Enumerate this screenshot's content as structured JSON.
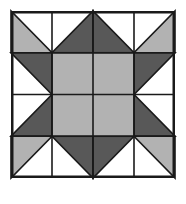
{
  "figure": {
    "name": "quilt-block-pattern",
    "canvas": {
      "width": 186,
      "height": 204,
      "background": "#ffffff"
    }
  },
  "colors": {
    "background": "#ffffff",
    "white": "#ffffff",
    "light_gray": "#b2b2b2",
    "dark_gray": "#585858",
    "outline": "#1a1a1a",
    "border": "#1a1a1a"
  },
  "block": {
    "x": 11,
    "y": 11,
    "width": 164,
    "height": 167,
    "grid_rows": 4,
    "grid_cols": 4,
    "cell_width": 41,
    "cell_height": 41.75,
    "border_width": 2.5,
    "grid_line_width": 1.6
  },
  "chart_data": {
    "type": "diagram",
    "grid": {
      "rows": 4,
      "cols": 4
    },
    "legend": [
      {
        "label": "Light gray",
        "color": "#b2b2b2"
      },
      {
        "label": "Dark gray",
        "color": "#585858"
      },
      {
        "label": "White",
        "color": "#ffffff"
      }
    ],
    "cells": [
      {
        "row": 0,
        "col": 0,
        "shape": "half-square-triangle",
        "orientation": "lower-left",
        "fill": "#b2b2b2",
        "other": "#ffffff"
      },
      {
        "row": 0,
        "col": 1,
        "shape": "half-square-triangle",
        "orientation": "lower-right",
        "fill": "#585858",
        "other": "#ffffff"
      },
      {
        "row": 0,
        "col": 2,
        "shape": "half-square-triangle",
        "orientation": "lower-left",
        "fill": "#585858",
        "other": "#ffffff"
      },
      {
        "row": 0,
        "col": 3,
        "shape": "half-square-triangle",
        "orientation": "lower-right",
        "fill": "#b2b2b2",
        "other": "#ffffff"
      },
      {
        "row": 1,
        "col": 0,
        "shape": "half-square-triangle",
        "orientation": "upper-right",
        "fill": "#585858",
        "other": "#ffffff"
      },
      {
        "row": 1,
        "col": 1,
        "shape": "solid",
        "fill": "#b2b2b2"
      },
      {
        "row": 1,
        "col": 2,
        "shape": "solid",
        "fill": "#b2b2b2"
      },
      {
        "row": 1,
        "col": 3,
        "shape": "half-square-triangle",
        "orientation": "upper-left",
        "fill": "#585858",
        "other": "#ffffff"
      },
      {
        "row": 2,
        "col": 0,
        "shape": "half-square-triangle",
        "orientation": "lower-right",
        "fill": "#585858",
        "other": "#ffffff"
      },
      {
        "row": 2,
        "col": 1,
        "shape": "solid",
        "fill": "#b2b2b2"
      },
      {
        "row": 2,
        "col": 2,
        "shape": "solid",
        "fill": "#b2b2b2"
      },
      {
        "row": 2,
        "col": 3,
        "shape": "half-square-triangle",
        "orientation": "lower-left",
        "fill": "#585858",
        "other": "#ffffff"
      },
      {
        "row": 3,
        "col": 0,
        "shape": "half-square-triangle",
        "orientation": "upper-left",
        "fill": "#b2b2b2",
        "other": "#ffffff"
      },
      {
        "row": 3,
        "col": 1,
        "shape": "half-square-triangle",
        "orientation": "upper-right",
        "fill": "#585858",
        "other": "#ffffff"
      },
      {
        "row": 3,
        "col": 2,
        "shape": "half-square-triangle",
        "orientation": "upper-left",
        "fill": "#585858",
        "other": "#ffffff"
      },
      {
        "row": 3,
        "col": 3,
        "shape": "half-square-triangle",
        "orientation": "upper-right",
        "fill": "#b2b2b2",
        "other": "#ffffff"
      }
    ],
    "center_square": {
      "x": 1,
      "y": 1,
      "w": 2,
      "h": 2,
      "fill": "#b2b2b2"
    }
  }
}
